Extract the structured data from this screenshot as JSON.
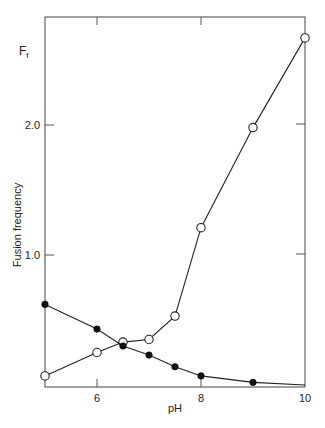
{
  "chart_data": {
    "type": "line",
    "title": "",
    "xlabel": "pH",
    "ylabel": "Fusion frequency",
    "ylabel_symbol": "F",
    "ylabel_symbol_sub": "f",
    "xlim": [
      5,
      10
    ],
    "ylim": [
      0,
      2.83
    ],
    "x_ticks": [
      6,
      8,
      10
    ],
    "x_tick_labels": [
      "6",
      "8",
      "10"
    ],
    "y_ticks": [
      1.0,
      2.0
    ],
    "y_tick_labels": [
      "1.0",
      "2.0"
    ],
    "grid": false,
    "legend": null,
    "series": [
      {
        "name": "open circles",
        "marker": "open-circle",
        "x": [
          5,
          6,
          6.5,
          7,
          7.5,
          8,
          9,
          10
        ],
        "values": [
          0.07,
          0.25,
          0.33,
          0.35,
          0.53,
          1.21,
          1.98,
          2.67
        ]
      },
      {
        "name": "filled circles",
        "marker": "filled-circle",
        "x": [
          5,
          6,
          6.5,
          7,
          7.5,
          8,
          9,
          10
        ],
        "values": [
          0.62,
          0.43,
          0.3,
          0.23,
          0.14,
          0.07,
          0.02,
          0.0
        ]
      }
    ]
  },
  "colors": {
    "axis": "#555555",
    "line": "#222222",
    "marker_fill_open": "#ffffff",
    "marker_fill_filled": "#111111"
  }
}
